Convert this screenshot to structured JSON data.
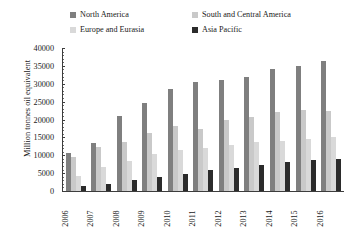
{
  "chart_data": {
    "type": "bar",
    "title": "",
    "xlabel": "",
    "ylabel": "Million tonnes oil equivalent",
    "ylim": [
      0,
      40000
    ],
    "ytick_step": 5000,
    "yticks": [
      "40000",
      "35000",
      "30000",
      "25000",
      "20000",
      "15000",
      "10000",
      "5000",
      "0"
    ],
    "grid": false,
    "legend_position": "top",
    "categories": [
      "2006",
      "2007",
      "2008",
      "2009",
      "2010",
      "2011",
      "2012",
      "2013",
      "2014",
      "2015",
      "2016"
    ],
    "series": [
      {
        "name": "North America",
        "color": "#7f7f7f",
        "values": [
          10500,
          13500,
          21000,
          24500,
          28500,
          30500,
          31000,
          32000,
          34000,
          35000,
          36500
        ]
      },
      {
        "name": "South and Central America",
        "color": "#c9c9c9",
        "values": [
          9500,
          12200,
          13800,
          16300,
          18300,
          17300,
          19800,
          20800,
          22000,
          22800,
          22300
        ]
      },
      {
        "name": "Europe and Eurasia",
        "color": "#d9d9d9",
        "values": [
          4300,
          6800,
          8400,
          10400,
          11600,
          12100,
          13000,
          13700,
          14000,
          14500,
          15000
        ]
      },
      {
        "name": "Asia Pacific",
        "color": "#2b2b2b",
        "values": [
          1500,
          2100,
          3200,
          4000,
          4800,
          5800,
          6500,
          7200,
          8200,
          8600,
          9000
        ]
      }
    ]
  },
  "legend": {
    "entries": [
      {
        "label": "North America",
        "color": "#7f7f7f"
      },
      {
        "label": "South and Central America",
        "color": "#c9c9c9"
      },
      {
        "label": "Europe and Eurasia",
        "color": "#d9d9d9"
      },
      {
        "label": "Asia Pacific",
        "color": "#2b2b2b"
      }
    ]
  },
  "axes": {
    "y_title": "Million tonnes oil equivalent"
  }
}
